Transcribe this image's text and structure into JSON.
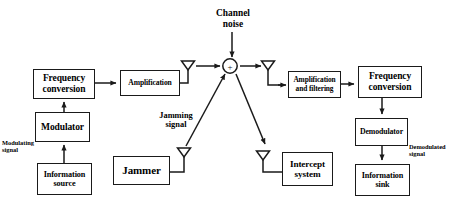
{
  "diagram": {
    "style": {
      "stroke_color": "#1a1a1a",
      "background_color": "#ffffff",
      "text_color": "#000000"
    },
    "nodes": [
      {
        "id": "freq-conv-tx",
        "label": "Frequency\nconversion",
        "name": "frequency-conversion-tx-box"
      },
      {
        "id": "amplification",
        "label": "Amplification",
        "name": "amplification-box"
      },
      {
        "id": "modulator",
        "label": "Modulator",
        "name": "modulator-box"
      },
      {
        "id": "info-source",
        "label": "Information\nsource",
        "name": "information-source-box"
      },
      {
        "id": "jammer",
        "label": "Jammer",
        "name": "jammer-box"
      },
      {
        "id": "intercept",
        "label": "Intercept\nsystem",
        "name": "intercept-system-box"
      },
      {
        "id": "amp-filter",
        "label": "Amplification\nand filtering",
        "name": "amplification-and-filtering-box"
      },
      {
        "id": "freq-conv-rx",
        "label": "Frequency\nconversion",
        "name": "frequency-conversion-rx-box"
      },
      {
        "id": "demodulator",
        "label": "Demodulator",
        "name": "demodulator-box"
      },
      {
        "id": "info-sink",
        "label": "Information\nsink",
        "name": "information-sink-box"
      }
    ],
    "labels": [
      {
        "id": "channel-noise",
        "text": "Channel\nnoise",
        "name": "channel-noise-label"
      },
      {
        "id": "jamming-signal",
        "text": "Jamming\nsignal",
        "name": "jamming-signal-label"
      },
      {
        "id": "modulating-signal",
        "text": "Modulating\nsignal",
        "name": "modulating-signal-label"
      },
      {
        "id": "demodulated-signal",
        "text": "Demodulated\nsignal",
        "name": "demodulated-signal-label"
      }
    ],
    "summing_junction": {
      "symbol": "+",
      "name": "summing-junction"
    },
    "antennas": [
      {
        "id": "tx-antenna",
        "name": "transmit-antenna-icon"
      },
      {
        "id": "rx-antenna",
        "name": "receive-antenna-icon"
      },
      {
        "id": "jammer-antenna",
        "name": "jammer-antenna-icon"
      },
      {
        "id": "intercept-antenna",
        "name": "intercept-antenna-icon"
      }
    ]
  }
}
